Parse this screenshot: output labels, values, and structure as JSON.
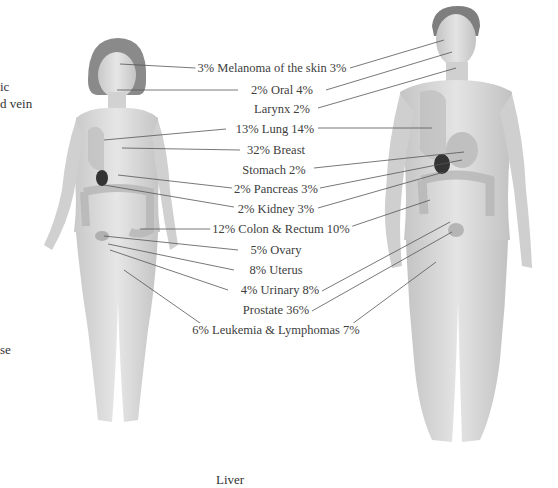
{
  "diagram": {
    "left_margin_fragments": [
      "ic",
      "d vein",
      "se"
    ],
    "bottom_fragment": "Liver",
    "figures": {
      "female": {
        "label": "female-figure"
      },
      "male": {
        "label": "male-figure"
      }
    },
    "labels": [
      {
        "id": "melanoma",
        "text": "3% Melanoma of the skin 3%",
        "female": "3%",
        "male": "3%",
        "site": "Melanoma of the skin"
      },
      {
        "id": "oral",
        "text": "2% Oral 4%",
        "female": "2%",
        "male": "4%",
        "site": "Oral"
      },
      {
        "id": "larynx",
        "text": "Larynx 2%",
        "female": null,
        "male": "2%",
        "site": "Larynx"
      },
      {
        "id": "lung",
        "text": "13% Lung 14%",
        "female": "13%",
        "male": "14%",
        "site": "Lung"
      },
      {
        "id": "breast",
        "text": "32% Breast",
        "female": "32%",
        "male": null,
        "site": "Breast"
      },
      {
        "id": "stomach",
        "text": "Stomach 2%",
        "female": null,
        "male": "2%",
        "site": "Stomach"
      },
      {
        "id": "pancreas",
        "text": "2% Pancreas 3%",
        "female": "2%",
        "male": "3%",
        "site": "Pancreas"
      },
      {
        "id": "kidney",
        "text": "2% Kidney 3%",
        "female": "2%",
        "male": "3%",
        "site": "Kidney"
      },
      {
        "id": "colon",
        "text": "12% Colon & Rectum 10%",
        "female": "12%",
        "male": "10%",
        "site": "Colon & Rectum"
      },
      {
        "id": "ovary",
        "text": "5% Ovary",
        "female": "5%",
        "male": null,
        "site": "Ovary"
      },
      {
        "id": "uterus",
        "text": "8% Uterus",
        "female": "8%",
        "male": null,
        "site": "Uterus"
      },
      {
        "id": "urinary",
        "text": "4% Urinary 8%",
        "female": "4%",
        "male": "8%",
        "site": "Urinary"
      },
      {
        "id": "prostate",
        "text": "Prostate 36%",
        "female": null,
        "male": "36%",
        "site": "Prostate"
      },
      {
        "id": "leukemia",
        "text": "6% Leukemia & Lymphomas 7%",
        "female": "6%",
        "male": "7%",
        "site": "Leukemia & Lymphomas"
      }
    ],
    "colors": {
      "line": "#555555",
      "text": "#404040",
      "skin": "#d8d8d8",
      "organ_dark": "#333333"
    }
  }
}
